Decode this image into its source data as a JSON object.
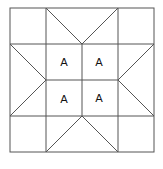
{
  "diagram": {
    "type": "quilt-block",
    "grid": "4x4",
    "center_labels": [
      "A",
      "A",
      "A",
      "A"
    ],
    "line_color": "#555555",
    "background": "#ffffff"
  }
}
